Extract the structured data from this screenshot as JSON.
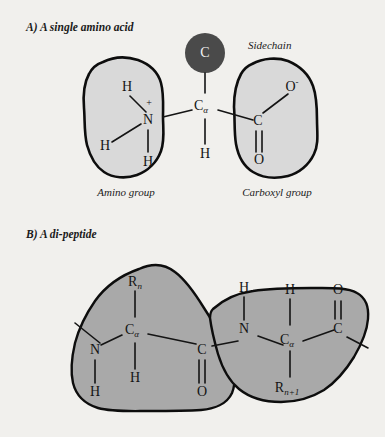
{
  "figure": {
    "background_color": "#f1f0ed",
    "panels": [
      {
        "id": "panel-a",
        "heading": "A) A single amino acid",
        "sidechain_label": "Sidechain",
        "sidechain_symbol": "R",
        "sidechain_circle_color": "#4a4a4a",
        "blob_fill": "#d9d9d9",
        "blob_outline": "#0d0d0d",
        "amino_group_label": "Amino group",
        "carboxyl_group_label": "Carboxyl group",
        "atoms": {
          "amino_h_top": "H",
          "amino_h_left": "H",
          "amino_n": "N",
          "amino_charge": "+",
          "amino_h_bottom": "H",
          "alpha_carbon": "C",
          "alpha_carbon_sub": "α",
          "alpha_h": "H",
          "carboxyl_c": "C",
          "carboxyl_o_single": "O",
          "carboxyl_o_charge": "-",
          "carboxyl_o_double": "O"
        }
      },
      {
        "id": "panel-b",
        "heading": "B) A di-peptide",
        "blob_fill": "#a9a9a9",
        "blob_outline": "#0d0d0d",
        "residue_left": {
          "r_symbol": "R",
          "r_subscript": "n",
          "n_atom": "N",
          "n_h": "H",
          "alpha_carbon": "C",
          "alpha_carbon_sub": "α",
          "alpha_h": "H",
          "carbonyl_c": "C",
          "carbonyl_o": "O"
        },
        "residue_right": {
          "n_h": "H",
          "n_atom": "N",
          "alpha_h": "H",
          "alpha_carbon": "C",
          "alpha_carbon_sub": "α",
          "r_symbol": "R",
          "r_subscript": "n+1",
          "carbonyl_c": "C",
          "carbonyl_o": "O"
        }
      }
    ]
  }
}
